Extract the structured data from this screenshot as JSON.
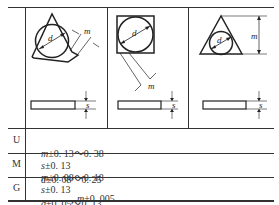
{
  "figures": [
    {
      "shape": "triangle-inscribed-circle-trimmed",
      "labels": {
        "d": "d",
        "m": "m",
        "s": "s"
      }
    },
    {
      "shape": "square-inscribed-circle",
      "labels": {
        "d": "d",
        "m": "m",
        "s": "s"
      }
    },
    {
      "shape": "triangle-inscribed-circle",
      "labels": {
        "d": "d",
        "m": "m",
        "s": "s"
      }
    }
  ],
  "rows": [
    {
      "grade": "U",
      "m_sym": "m",
      "m_tol": "±0. 13～0. 38",
      "s_sym": "s",
      "s_tol": "±0. 13",
      "d_sym": "d",
      "d_tol": "±0. 08～0. 25"
    },
    {
      "grade": "M",
      "m_sym": "m",
      "m_tol": "±0. 08～0. 18",
      "s_sym": "s",
      "s_tol": "±0. 13",
      "d_sym": "d",
      "d_tol": "±0. 05～0. 13"
    },
    {
      "grade": "G",
      "m_sym": "m",
      "m_tol": "±0. 005",
      "s_sym": "s",
      "s_tol": "±0. 05",
      "d_sym": "d",
      "d_tol": "±0. 13"
    }
  ]
}
